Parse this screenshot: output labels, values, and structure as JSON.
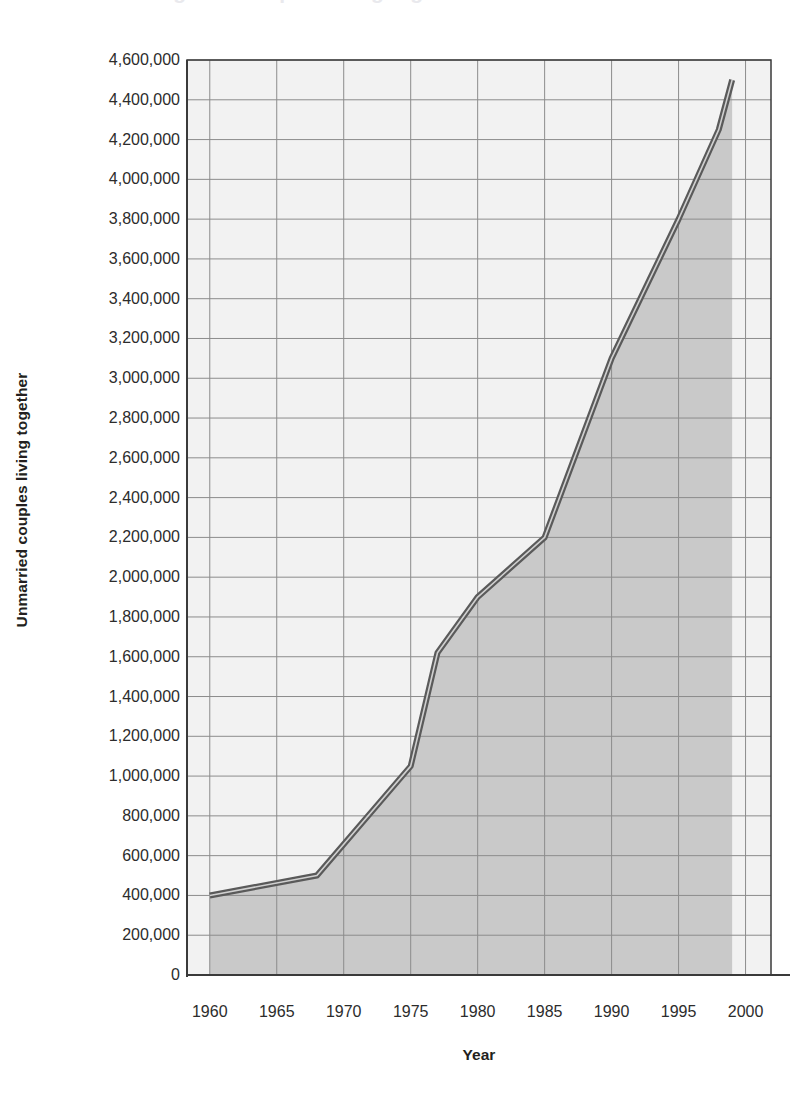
{
  "figure": {
    "ghost_title_fragment": "Changes in couples living together",
    "background_color": "#ffffff",
    "plot_fill_color": "#c9c9c9",
    "plot_background_color": "#f2f2f2",
    "grid_color": "#8c8c8c",
    "axis_color": "#3a3a3a",
    "line_color": "#5a5a5a",
    "line_highlight_color": "#d0d0d0",
    "text_color": "#231f20"
  },
  "axes": {
    "y_title": "Unmarried couples living together",
    "x_title": "Year"
  },
  "chart_data": {
    "type": "area",
    "title": "",
    "subtitle": "",
    "xlabel": "Year",
    "ylabel": "Unmarried couples living together",
    "xlim": [
      1958.3,
      2001.9
    ],
    "ylim": [
      0,
      4600000
    ],
    "grid": true,
    "legend": false,
    "legend_position": "none",
    "x_tick_labels": [
      "1960",
      "1965",
      "1970",
      "1975",
      "1980",
      "1985",
      "1990",
      "1995",
      "2000"
    ],
    "x_tick_values": [
      1960,
      1965,
      1970,
      1975,
      1980,
      1985,
      1990,
      1995,
      2000
    ],
    "x_minor_step": 5,
    "y_tick_labels": [
      "4,600,000",
      "4,400,000",
      "4,200,000",
      "4,000,000",
      "3,800,000",
      "3,600,000",
      "3,400,000",
      "3,200,000",
      "3,000,000",
      "2,800,000",
      "2,600,000",
      "2,400,000",
      "2,200,000",
      "2,000,000",
      "1,800,000",
      "1,600,000",
      "1,400,000",
      "1,200,000",
      "1,000,000",
      "800,000",
      "600,000",
      "400,000",
      "200,000",
      "0"
    ],
    "y_tick_values": [
      4600000,
      4400000,
      4200000,
      4000000,
      3800000,
      3600000,
      3400000,
      3200000,
      3000000,
      2800000,
      2600000,
      2400000,
      2200000,
      2000000,
      1800000,
      1600000,
      1400000,
      1200000,
      1000000,
      800000,
      600000,
      400000,
      200000,
      0
    ],
    "y_tick_step": 200000,
    "series": [
      {
        "name": "Unmarried couples living together",
        "x": [
          1960,
          1968,
          1975,
          1977,
          1980,
          1985,
          1990,
          1995,
          1998,
          1999
        ],
        "values": [
          400000,
          500000,
          1050000,
          1620000,
          1900000,
          2200000,
          3100000,
          3800000,
          4250000,
          4500000
        ]
      }
    ]
  }
}
